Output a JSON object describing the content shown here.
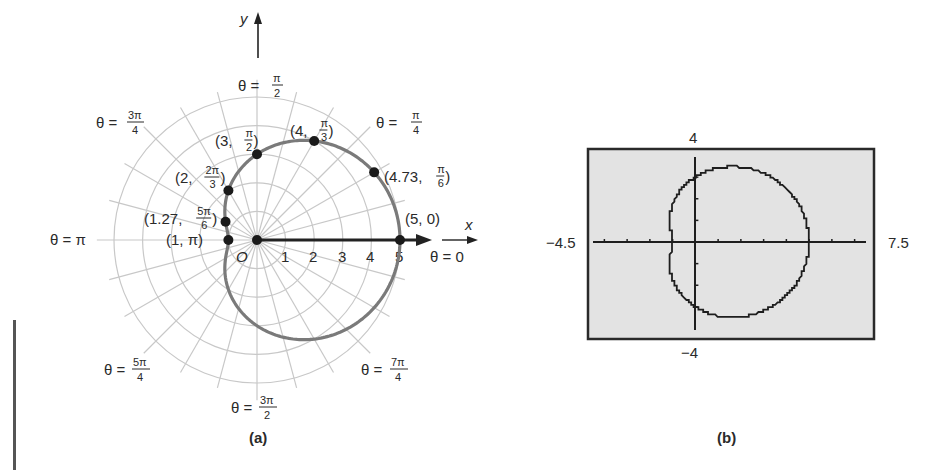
{
  "chart_data": [
    {
      "panel": "(a)",
      "type": "line",
      "subtype": "polar",
      "equation_implied": "r = 3 + 2cos(theta)",
      "title": "",
      "xlabel": "x",
      "ylabel": "y",
      "pole_label": "O",
      "polar_axis_ticks": [
        "1",
        "2",
        "3",
        "4",
        "5"
      ],
      "grid": {
        "rings": [
          1,
          2,
          3,
          4,
          5
        ],
        "radial_step_deg": 15
      },
      "angle_labels": [
        {
          "angle": "0",
          "text": "θ = 0"
        },
        {
          "angle": "π/4",
          "text": "θ = π/4"
        },
        {
          "angle": "π/2",
          "text": "θ = π/2"
        },
        {
          "angle": "3π/4",
          "text": "θ = 3π/4"
        },
        {
          "angle": "π",
          "text": "θ = π"
        },
        {
          "angle": "5π/4",
          "text": "θ = 5π/4"
        },
        {
          "angle": "3π/2",
          "text": "θ = 3π/2"
        },
        {
          "angle": "7π/4",
          "text": "θ = 7π/4"
        }
      ],
      "points": [
        {
          "r": 5,
          "theta": "0",
          "label": "(5, 0)"
        },
        {
          "r": 4.73,
          "theta": "π/6",
          "label": "(4.73, π/6)"
        },
        {
          "r": 4,
          "theta": "π/3",
          "label": "(4, π/3)"
        },
        {
          "r": 3,
          "theta": "π/2",
          "label": "(3, π/2)"
        },
        {
          "r": 2,
          "theta": "2π/3",
          "label": "(2, 2π/3)"
        },
        {
          "r": 1.27,
          "theta": "5π/6",
          "label": "(1.27, 5π/6)"
        },
        {
          "r": 1,
          "theta": "π",
          "label": "(1, π)"
        }
      ],
      "caption": "(a)"
    },
    {
      "panel": "(b)",
      "type": "line",
      "subtype": "graphing-calculator-window",
      "xlim": [
        -4.5,
        7.5
      ],
      "ylim": [
        -4,
        4
      ],
      "xscale": 1,
      "yscale": 1,
      "window_labels": {
        "xmin": "−4.5",
        "xmax": "7.5",
        "ymax": "4",
        "ymin": "−4"
      },
      "curve": "closed limaçon r = 3 + 2cos(theta), x from 0.?? to 5, passing (5,0), (-1,0), (0,±3)",
      "caption": "(b)"
    }
  ],
  "panel_a": {
    "axis_labels": {
      "x": "x",
      "y": "y",
      "origin": "O"
    },
    "ticks": [
      "1",
      "2",
      "3",
      "4",
      "5"
    ],
    "angles": {
      "a0": {
        "pre": "θ = 0",
        "num": "",
        "den": ""
      },
      "a45": {
        "pre": "θ = ",
        "num": "π",
        "den": "4"
      },
      "a90": {
        "pre": "θ = ",
        "num": "π",
        "den": "2"
      },
      "a135": {
        "pre": "θ = ",
        "num": "3π",
        "den": "4"
      },
      "a180": {
        "pre": "θ = π",
        "num": "",
        "den": ""
      },
      "a225": {
        "pre": "θ = ",
        "num": "5π",
        "den": "4"
      },
      "a270": {
        "pre": "θ = ",
        "num": "3π",
        "den": "2"
      },
      "a315": {
        "pre": "θ = ",
        "num": "7π",
        "den": "4"
      }
    },
    "points": {
      "p0": {
        "pre": "(5, 0)",
        "num": "",
        "den": "",
        "post": ""
      },
      "p30": {
        "pre": "(4.73, ",
        "num": "π",
        "den": "6",
        "post": ")"
      },
      "p60": {
        "pre": "(4, ",
        "num": "π",
        "den": "3",
        "post": ")"
      },
      "p90": {
        "pre": "(3, ",
        "num": "π",
        "den": "2",
        "post": ")"
      },
      "p120": {
        "pre": "(2, ",
        "num": "2π",
        "den": "3",
        "post": ")"
      },
      "p150": {
        "pre": "(1.27, ",
        "num": "5π",
        "den": "6",
        "post": ")"
      },
      "p180": {
        "pre": "(1, π)",
        "num": "",
        "den": "",
        "post": ""
      }
    },
    "caption": "(a)",
    "colors": {
      "grid": "#c8c8c8",
      "curve": "#7a7a7a",
      "axis": "#222222",
      "point": "#1a1a1a"
    }
  },
  "panel_b": {
    "labels": {
      "ymax": "4",
      "ymin": "−4",
      "xmin": "−4.5",
      "xmax": "7.5"
    },
    "caption": "(b)",
    "colors": {
      "screen": "#e3e3e3",
      "frame": "#2a2a2a",
      "curve": "#1e1e1e"
    }
  }
}
